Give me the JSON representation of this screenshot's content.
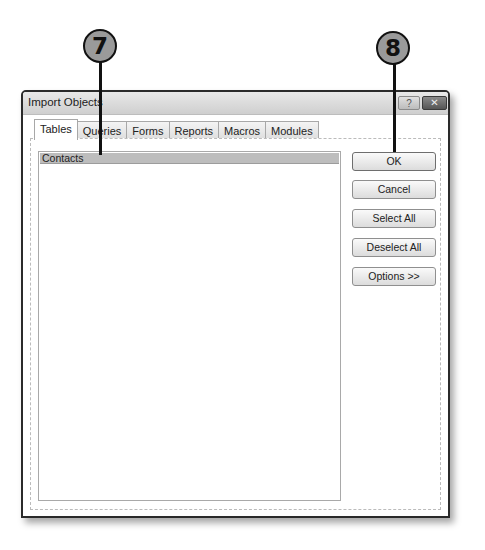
{
  "callouts": [
    {
      "number": "7"
    },
    {
      "number": "8"
    }
  ],
  "dialog": {
    "title": "Import Objects",
    "help_glyph": "?",
    "close_glyph": "✕",
    "tabs": [
      {
        "label": "Tables",
        "active": true
      },
      {
        "label": "Queries",
        "active": false
      },
      {
        "label": "Forms",
        "active": false
      },
      {
        "label": "Reports",
        "active": false
      },
      {
        "label": "Macros",
        "active": false
      },
      {
        "label": "Modules",
        "active": false
      }
    ],
    "list": {
      "items": [
        {
          "label": "Contacts",
          "selected": true
        }
      ]
    },
    "buttons": {
      "ok": "OK",
      "cancel": "Cancel",
      "select_all": "Select All",
      "deselect_all": "Deselect All",
      "options": "Options >>"
    }
  }
}
